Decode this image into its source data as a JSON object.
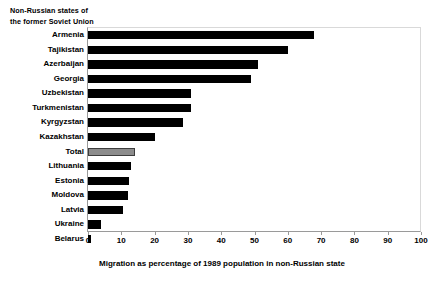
{
  "chart_data": {
    "type": "bar",
    "orientation": "horizontal",
    "title": "",
    "note_lines": [
      "Non-Russian states of",
      "the former Soviet Union"
    ],
    "xlabel": "Migration as percentage of 1989 population in non-Russian state",
    "ylabel": "",
    "xlim": [
      0,
      100
    ],
    "xticks": [
      0,
      10,
      20,
      30,
      40,
      50,
      60,
      70,
      80,
      90,
      100
    ],
    "grid": false,
    "legend": "none",
    "categories": [
      "Armenia",
      "Tajikistan",
      "Azerbaijan",
      "Georgia",
      "Uzbekistan",
      "Turkmenistan",
      "Kyrgyzstan",
      "Kazakhstan",
      "Total",
      "Lithuania",
      "Estonia",
      "Moldova",
      "Latvia",
      "Ukraine",
      "Belarus"
    ],
    "values": [
      68,
      60,
      51,
      49,
      31,
      31,
      28.5,
      20,
      14,
      13,
      12.3,
      12,
      10.5,
      4,
      1
    ],
    "highlight_category": "Total",
    "colors": {
      "bar": "#000000",
      "highlight_bar": "#8c8c8c",
      "highlight_border": "#3d3d3d",
      "axis": "#9a9a9a",
      "frame": "#d9d9d9",
      "text": "#000000",
      "background": "#ffffff"
    }
  }
}
